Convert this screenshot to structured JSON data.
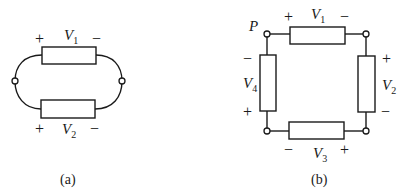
{
  "figure_a": {
    "caption": "(a)",
    "elements": [
      {
        "name": "V",
        "sub": "1",
        "plus": "+",
        "minus": "−"
      },
      {
        "name": "V",
        "sub": "2",
        "plus": "+",
        "minus": "−"
      }
    ]
  },
  "figure_b": {
    "caption": "(b)",
    "node_label": "P",
    "elements": [
      {
        "name": "V",
        "sub": "1",
        "plus": "+",
        "minus": "−"
      },
      {
        "name": "V",
        "sub": "2",
        "plus": "+",
        "minus": "−"
      },
      {
        "name": "V",
        "sub": "3",
        "plus": "+",
        "minus": "−"
      },
      {
        "name": "V",
        "sub": "4",
        "plus": "+",
        "minus": "−"
      }
    ]
  },
  "colors": {
    "stroke": "#1a1a1a",
    "background": "#ffffff"
  }
}
